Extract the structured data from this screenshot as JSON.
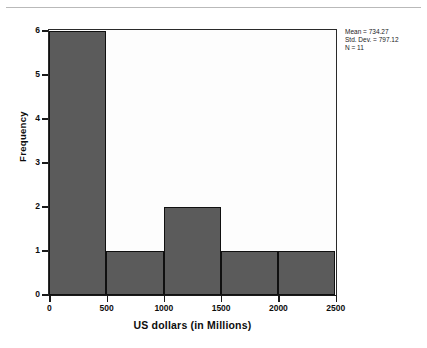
{
  "chart_data": {
    "type": "bar",
    "chart_subtype": "histogram",
    "title": "",
    "xlabel": "US dollars (in Millions)",
    "ylabel": "Frequency",
    "bin_width": 500,
    "bin_edges": [
      0,
      500,
      1000,
      1500,
      2000,
      2500
    ],
    "categories": [
      "0-500",
      "500-1000",
      "1000-1500",
      "1500-2000",
      "2000-2500"
    ],
    "values": [
      6,
      1,
      2,
      1,
      1
    ],
    "xlim": [
      0,
      2500
    ],
    "ylim": [
      0,
      6
    ],
    "xticks": [
      0,
      500,
      1000,
      1500,
      2000,
      2500
    ],
    "xtick_labels": [
      "0",
      "500",
      "1000",
      "1500",
      "2000",
      "2500"
    ],
    "yticks": [
      0,
      1,
      2,
      3,
      4,
      5,
      6
    ],
    "ytick_labels": [
      "0",
      "1",
      "2",
      "3",
      "4",
      "5",
      "6"
    ],
    "grid": false,
    "legend": false,
    "bar_color": "#5b5b5b",
    "bar_edge_color": "#101010",
    "plot_background": "#fdfdfd",
    "annotations": [
      "Mean = 734.27",
      "Std. Dev. = 797.12",
      "N = 11"
    ]
  },
  "stats": {
    "mean": "Mean = 734.27",
    "std_dev": "Std. Dev. = 797.12",
    "n": "N = 11"
  }
}
